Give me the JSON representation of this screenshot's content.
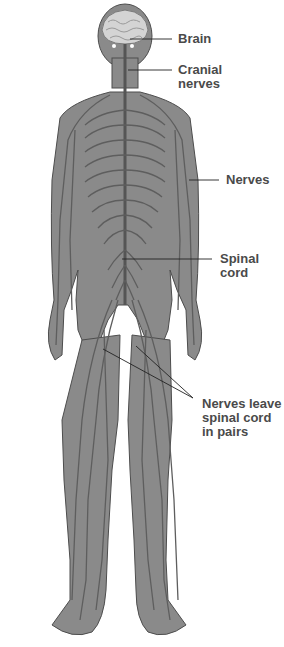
{
  "diagram": {
    "type": "anatomical-illustration",
    "colors": {
      "body_fill": "#8a8a8a",
      "body_outline": "#4d4d4d",
      "nerve": "#5e5e5e",
      "brain": "#d4d4d4",
      "leader_line": "#222222",
      "label_text": "#4a4a4a",
      "background": "#ffffff"
    },
    "labels": {
      "brain": "Brain",
      "cranial_nerves": "Cranial\nnerves",
      "nerves": "Nerves",
      "spinal_cord": "Spinal\ncord",
      "nerves_leave": "Nerves leave\nspinal cord\nin pairs"
    }
  }
}
